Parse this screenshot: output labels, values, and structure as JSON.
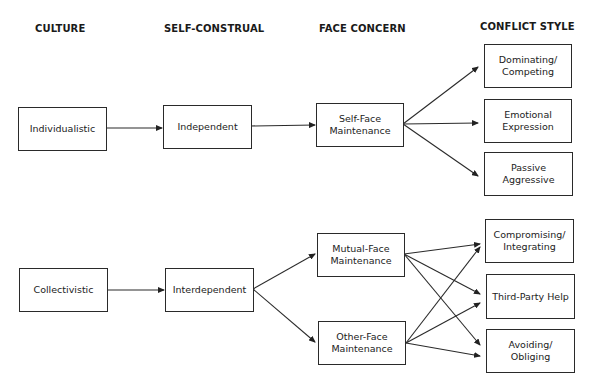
{
  "headers": {
    "culture": "CULTURE",
    "self_construal": "SELF-CONSTRUAL",
    "face_concern": "FACE CONCERN",
    "conflict_style": "CONFLICT STYLE"
  },
  "culture": {
    "individualistic": "Individualistic",
    "collectivistic": "Collectivistic"
  },
  "self_construal": {
    "independent": "Independent",
    "interdependent": "Interdependent"
  },
  "face_concern": {
    "self_face": "Self-Face Maintenance",
    "mutual_face": "Mutual-Face Maintenance",
    "other_face": "Other-Face Maintenance"
  },
  "conflict_style": {
    "dominating": "Dominating/ Competing",
    "emotional": "Emotional Expression",
    "passive_aggressive": "Passive Aggressive",
    "compromising": "Compromising/ Integrating",
    "third_party": "Third-Party Help",
    "avoiding": "Avoiding/ Obliging"
  },
  "connections": [
    [
      "Individualistic",
      "Independent"
    ],
    [
      "Independent",
      "Self-Face Maintenance"
    ],
    [
      "Self-Face Maintenance",
      "Dominating/ Competing"
    ],
    [
      "Self-Face Maintenance",
      "Emotional Expression"
    ],
    [
      "Self-Face Maintenance",
      "Passive Aggressive"
    ],
    [
      "Collectivistic",
      "Interdependent"
    ],
    [
      "Interdependent",
      "Mutual-Face Maintenance"
    ],
    [
      "Interdependent",
      "Other-Face Maintenance"
    ],
    [
      "Mutual-Face Maintenance",
      "Compromising/ Integrating"
    ],
    [
      "Mutual-Face Maintenance",
      "Third-Party Help"
    ],
    [
      "Mutual-Face Maintenance",
      "Avoiding/ Obliging"
    ],
    [
      "Other-Face Maintenance",
      "Compromising/ Integrating"
    ],
    [
      "Other-Face Maintenance",
      "Third-Party Help"
    ],
    [
      "Other-Face Maintenance",
      "Avoiding/ Obliging"
    ]
  ]
}
